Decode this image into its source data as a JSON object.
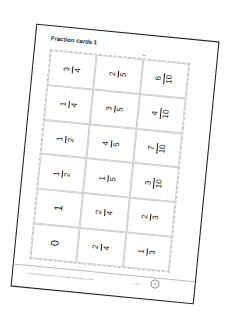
{
  "page": {
    "title": "Fraction cards 1",
    "scissors_icon": "✂",
    "footer_text": "Cambridge Mathematics Ks2 1 © Cambridge University Press 2008",
    "footer_code": "CC 4.3.1",
    "badge_label": "N"
  },
  "cards": [
    {
      "row": 1,
      "col": 1,
      "type": "fraction",
      "numerator": "3",
      "denominator": "4"
    },
    {
      "row": 1,
      "col": 2,
      "type": "fraction",
      "numerator": "2",
      "denominator": "5"
    },
    {
      "row": 1,
      "col": 3,
      "type": "fraction",
      "numerator": "6",
      "denominator": "10"
    },
    {
      "row": 2,
      "col": 1,
      "type": "fraction",
      "numerator": "1",
      "denominator": "4"
    },
    {
      "row": 2,
      "col": 2,
      "type": "fraction",
      "numerator": "3",
      "denominator": "5"
    },
    {
      "row": 2,
      "col": 3,
      "type": "fraction",
      "numerator": "4",
      "denominator": "10"
    },
    {
      "row": 3,
      "col": 1,
      "type": "fraction",
      "numerator": "1",
      "denominator": "2"
    },
    {
      "row": 3,
      "col": 2,
      "type": "fraction",
      "numerator": "4",
      "denominator": "5"
    },
    {
      "row": 3,
      "col": 3,
      "type": "fraction",
      "numerator": "7",
      "denominator": "10"
    },
    {
      "row": 4,
      "col": 1,
      "type": "fraction",
      "numerator": "1",
      "denominator": "2"
    },
    {
      "row": 4,
      "col": 2,
      "type": "fraction",
      "numerator": "1",
      "denominator": "5"
    },
    {
      "row": 4,
      "col": 3,
      "type": "fraction",
      "numerator": "3",
      "denominator": "10"
    },
    {
      "row": 5,
      "col": 1,
      "type": "whole",
      "value": "1"
    },
    {
      "row": 5,
      "col": 2,
      "type": "fraction",
      "numerator": "2",
      "denominator": "4"
    },
    {
      "row": 5,
      "col": 3,
      "type": "fraction",
      "numerator": "2",
      "denominator": "3"
    },
    {
      "row": 6,
      "col": 1,
      "type": "whole",
      "value": "0"
    },
    {
      "row": 6,
      "col": 2,
      "type": "fraction",
      "numerator": "2",
      "denominator": "4"
    },
    {
      "row": 6,
      "col": 3,
      "type": "fraction",
      "numerator": "1",
      "denominator": "3"
    }
  ]
}
